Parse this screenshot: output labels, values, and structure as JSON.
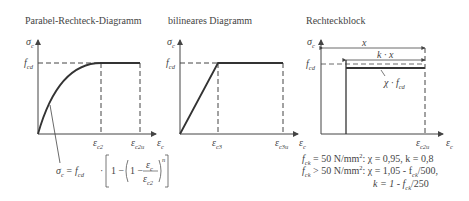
{
  "diagrams": [
    {
      "title": "Parabel-Rechteck-Diagramm",
      "y_axis": {
        "symbol": "σ",
        "sub": "c"
      },
      "x_axis": {
        "symbol": "ε",
        "sub": "c"
      },
      "level_label": {
        "symbol": "f",
        "sub": "cd"
      },
      "ticks": [
        {
          "symbol": "ε",
          "sub": "c2"
        },
        {
          "symbol": "ε",
          "sub": "c2u"
        }
      ],
      "formula": {
        "lhs": "σ",
        "lhs_sub": "c",
        "eq": "= f",
        "eq_sub": "cd",
        "body": "· 1 − (1 −",
        "num": "ε",
        "num_sub": "c",
        "den": "ε",
        "den_sub": "c2",
        "exponent": "n"
      }
    },
    {
      "title": "bilineares Diagramm",
      "y_axis": {
        "symbol": "σ",
        "sub": "c"
      },
      "x_axis": {
        "symbol": "ε",
        "sub": "c"
      },
      "level_label": {
        "symbol": "f",
        "sub": "cd"
      },
      "ticks": [
        {
          "symbol": "ε",
          "sub": "c3"
        },
        {
          "symbol": "ε",
          "sub": "c3u"
        }
      ]
    },
    {
      "title": "Rechteckblock",
      "y_axis": {
        "symbol": "σ",
        "sub": "c"
      },
      "x_axis": {
        "symbol": "ε",
        "sub": "c"
      },
      "level_label": {
        "symbol": "f",
        "sub": "cd"
      },
      "ticks": [
        {
          "symbol": "ε",
          "sub": "c2u"
        }
      ],
      "dim_x": "x",
      "dim_kx": "k · x",
      "block_label": {
        "symbol": "χ · f",
        "sub": "cd"
      },
      "notes": [
        {
          "lhs": "f",
          "lhs_sub": "ck",
          "rest": " = 50 N/mm",
          "sup": "2",
          "tail": ": χ = 0,95, k = 0,8"
        },
        {
          "lhs": "f",
          "lhs_sub": "ck",
          "rest": " > 50 N/mm",
          "sup": "2",
          "tail": ": χ = 1,05 - f",
          "tail_sub": "ck",
          "tail2": "/500,"
        },
        {
          "lhs": "k = 1 - f",
          "lhs_sub": "ck",
          "rest": "/250"
        }
      ]
    }
  ]
}
